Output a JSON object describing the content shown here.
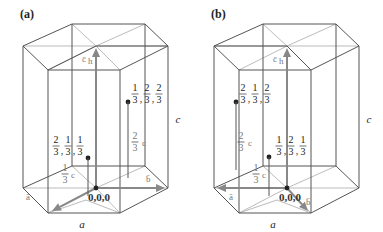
{
  "panels": [
    {
      "id": "a",
      "label": "(a)",
      "vectors": {
        "a": "a",
        "b": "b",
        "c": "c",
        "sub": "h"
      },
      "origin_label": "0,0,0",
      "atom_upper": {
        "coords": [
          [
            "1",
            "3"
          ],
          [
            "2",
            "3"
          ],
          [
            "2",
            "3"
          ]
        ]
      },
      "atom_lower": {
        "coords": [
          [
            "2",
            "3"
          ],
          [
            "1",
            "3"
          ],
          [
            "1",
            "3"
          ]
        ]
      },
      "height_upper": [
        "2",
        "3",
        "c"
      ],
      "height_lower": [
        "1",
        "3",
        "c"
      ],
      "edge_label_a": "a",
      "edge_label_c": "c"
    },
    {
      "id": "b",
      "label": "(b)",
      "vectors": {
        "a": "a",
        "b": "b",
        "c": "c",
        "sub": "h"
      },
      "origin_label": "0,0,0",
      "atom_upper": {
        "coords": [
          [
            "2",
            "3"
          ],
          [
            "1",
            "3"
          ],
          [
            "2",
            "3"
          ]
        ]
      },
      "atom_lower": {
        "coords": [
          [
            "1",
            "3"
          ],
          [
            "2",
            "3"
          ],
          [
            "1",
            "3"
          ]
        ]
      },
      "height_upper": [
        "2",
        "3",
        "c"
      ],
      "height_lower": [
        "1",
        "3",
        "c"
      ],
      "edge_label_a": "a",
      "edge_label_c": "c"
    }
  ]
}
